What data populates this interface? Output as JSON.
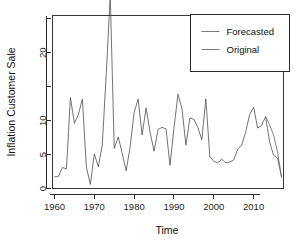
{
  "chart_data": {
    "type": "line",
    "title": "",
    "xlabel": "Time",
    "ylabel": "Inflation Customer Sale",
    "xlim": [
      1959.5,
      2017.5
    ],
    "ylim": [
      0,
      25.5
    ],
    "grid": false,
    "legend_position": "top-right",
    "x_ticks": [
      1960,
      1970,
      1980,
      1990,
      2000,
      2010
    ],
    "x_tick_labels": [
      "1960",
      "1970",
      "1980",
      "1990",
      "2000",
      "2010"
    ],
    "y_ticks": [
      0,
      5,
      10,
      15,
      20,
      25
    ],
    "y_tick_labels": [
      "0",
      "5",
      "10",
      "",
      "20",
      ""
    ],
    "series": [
      {
        "name": "Original",
        "color": "#5a5a5a",
        "x": [
          1960,
          1961,
          1962,
          1963,
          1964,
          1965,
          1966,
          1967,
          1968,
          1969,
          1970,
          1971,
          1972,
          1973,
          1974,
          1975,
          1976,
          1977,
          1978,
          1979,
          1980,
          1981,
          1982,
          1983,
          1984,
          1985,
          1986,
          1987,
          1988,
          1989,
          1990,
          1991,
          1992,
          1993,
          1994,
          1995,
          1996,
          1997,
          1998,
          1999,
          2000,
          2001,
          2002,
          2003,
          2004,
          2005,
          2006,
          2007,
          2008,
          2009,
          2010,
          2011,
          2012,
          2013,
          2014,
          2015,
          2016,
          2017
        ],
        "values": [
          1.7,
          1.8,
          3.1,
          2.9,
          13.4,
          9.6,
          10.9,
          13.2,
          3.2,
          0.6,
          5.1,
          3.2,
          6.4,
          16.9,
          28.6,
          5.9,
          7.6,
          5.2,
          2.6,
          6.2,
          11.2,
          13.2,
          7.9,
          11.9,
          8.3,
          5.5,
          8.7,
          9.0,
          8.8,
          3.4,
          8.9,
          13.9,
          11.8,
          6.4,
          10.4,
          10.2,
          9.0,
          7.2,
          13.2,
          4.7,
          4.0,
          3.8,
          4.3,
          3.8,
          3.9,
          4.2,
          5.8,
          6.4,
          8.3,
          10.9,
          12.0,
          8.9,
          9.3,
          10.6,
          6.9,
          4.9,
          4.5,
          1.7
        ]
      },
      {
        "name": "Forecasted",
        "color": "#6e6e6e",
        "x": [
          2013,
          2014,
          2015,
          2016,
          2017
        ],
        "values": [
          10.6,
          9.4,
          7.9,
          5.4,
          1.7
        ]
      }
    ],
    "legend": [
      {
        "label": "Forecasted",
        "color": "#6e6e6e"
      },
      {
        "label": "Original",
        "color": "#6a6a6a"
      }
    ]
  },
  "axes": {
    "x_title": "Time",
    "y_title": "Inflation Customer Sale"
  }
}
